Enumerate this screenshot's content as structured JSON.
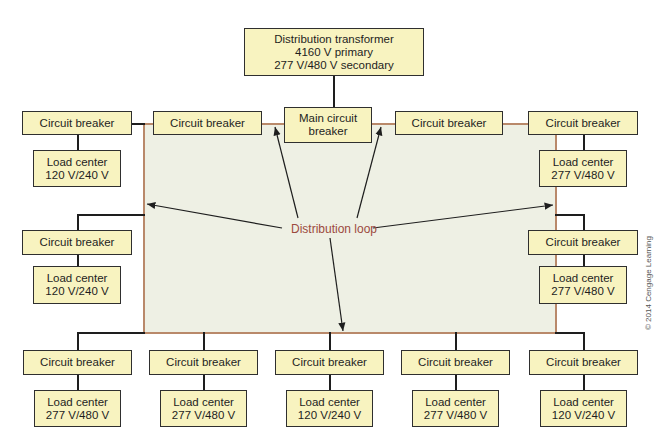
{
  "transformer": {
    "line1": "Distribution transformer",
    "line2": "4160 V primary",
    "line3": "277 V/480 V secondary"
  },
  "main_breaker": {
    "line1": "Main circuit",
    "line2": "breaker"
  },
  "loop_label": "Distribution loop",
  "breaker_label": "Circuit breaker",
  "top_row": [
    {
      "breaker": "Circuit breaker",
      "load": [
        "Load center",
        "120 V/240 V"
      ]
    },
    {
      "breaker": "Circuit breaker"
    },
    {
      "breaker": "Circuit breaker"
    },
    {
      "breaker": "Circuit breaker",
      "load": [
        "Load center",
        "277 V/480 V"
      ]
    }
  ],
  "middle_row": [
    {
      "breaker": "Circuit breaker",
      "load": [
        "Load center",
        "120 V/240 V"
      ]
    },
    {
      "breaker": "Circuit breaker",
      "load": [
        "Load center",
        "277 V/480 V"
      ]
    }
  ],
  "bottom_row": [
    {
      "breaker": "Circuit breaker",
      "load": [
        "Load center",
        "277 V/480 V"
      ]
    },
    {
      "breaker": "Circuit breaker",
      "load": [
        "Load center",
        "277 V/480 V"
      ]
    },
    {
      "breaker": "Circuit breaker",
      "load": [
        "Load center",
        "120 V/240 V"
      ]
    },
    {
      "breaker": "Circuit breaker",
      "load": [
        "Load center",
        "277 V/480 V"
      ]
    },
    {
      "breaker": "Circuit breaker",
      "load": [
        "Load center",
        "120 V/240 V"
      ]
    }
  ],
  "credit": "© 2014 Cengage Learning",
  "colors": {
    "box_fill": "#f8f3c0",
    "loop_fill": "#eef0e4",
    "loop_border": "#b9896a",
    "label": "#9c4a3e"
  }
}
